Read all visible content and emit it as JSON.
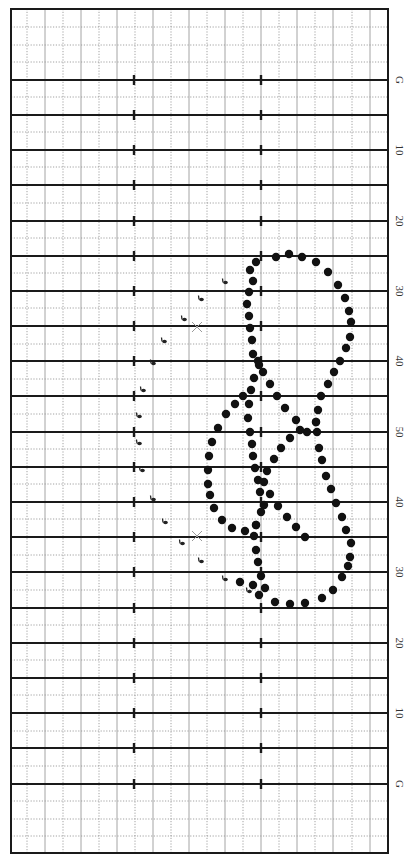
{
  "diagram": {
    "type": "marching-band-drill-chart",
    "orientation": "vertical-field",
    "colors": {
      "background": "#ffffff",
      "frame": "#1a1a1a",
      "yard_line": "#1a1a1a",
      "grid_solid": "#9a9a9a",
      "grid_dotted": "#8a8a8a",
      "dot": "#111111",
      "marker": "#222222",
      "x_mark": "#9a9a9a",
      "label": "#333333"
    },
    "field": {
      "frame": {
        "x": 11,
        "y": 9,
        "width": 377,
        "height": 844
      },
      "yard_lines_y": [
        80,
        115,
        150,
        185,
        221,
        256,
        291,
        326,
        361,
        396,
        432,
        467,
        502,
        537,
        572,
        608,
        643,
        678,
        713,
        748,
        784
      ],
      "hash_marks_x": [
        134,
        261
      ],
      "minor_lines_y_dotted": [
        27,
        45,
        62,
        97,
        132,
        167,
        203,
        238,
        273,
        308,
        344,
        379,
        414,
        449,
        484,
        519,
        555,
        590,
        625,
        660,
        695,
        731,
        766,
        801,
        819,
        836
      ],
      "vertical_lines_solid_x": [
        45,
        81,
        117,
        153,
        189,
        225,
        261,
        297,
        333,
        370
      ],
      "vertical_lines_dotted_x": [
        27,
        63,
        99,
        135,
        171,
        207,
        243,
        279,
        315,
        352
      ]
    },
    "yard_labels": [
      {
        "text": "G",
        "y": 80
      },
      {
        "text": "10",
        "y": 150
      },
      {
        "text": "20",
        "y": 221
      },
      {
        "text": "30",
        "y": 291
      },
      {
        "text": "40",
        "y": 361
      },
      {
        "text": "50",
        "y": 432
      },
      {
        "text": "40",
        "y": 502
      },
      {
        "text": "30",
        "y": 572
      },
      {
        "text": "20",
        "y": 643
      },
      {
        "text": "10",
        "y": 713
      },
      {
        "text": "G",
        "y": 784
      }
    ],
    "label_x": 400,
    "formation_dots": [
      [
        276,
        257
      ],
      [
        289,
        254
      ],
      [
        302,
        257
      ],
      [
        316,
        262
      ],
      [
        328,
        272
      ],
      [
        338,
        285
      ],
      [
        345,
        298
      ],
      [
        349,
        311
      ],
      [
        351,
        322
      ],
      [
        350,
        337
      ],
      [
        346,
        348
      ],
      [
        340,
        361
      ],
      [
        334,
        372
      ],
      [
        328,
        384
      ],
      [
        321,
        396
      ],
      [
        318,
        410
      ],
      [
        316,
        422
      ],
      [
        317,
        432
      ],
      [
        319,
        448
      ],
      [
        322,
        460
      ],
      [
        326,
        476
      ],
      [
        331,
        489
      ],
      [
        336,
        503
      ],
      [
        342,
        517
      ],
      [
        346,
        530
      ],
      [
        351,
        543
      ],
      [
        350,
        557
      ],
      [
        348,
        566
      ],
      [
        342,
        577
      ],
      [
        333,
        590
      ],
      [
        322,
        598
      ],
      [
        305,
        603
      ],
      [
        290,
        604
      ],
      [
        275,
        602
      ],
      [
        259,
        595
      ],
      [
        253,
        585
      ],
      [
        256,
        262
      ],
      [
        250,
        270
      ],
      [
        253,
        281
      ],
      [
        249,
        292
      ],
      [
        247,
        304
      ],
      [
        249,
        316
      ],
      [
        250,
        328
      ],
      [
        252,
        340
      ],
      [
        253,
        354
      ],
      [
        258,
        361
      ],
      [
        263,
        372
      ],
      [
        270,
        384
      ],
      [
        277,
        396
      ],
      [
        285,
        408
      ],
      [
        296,
        420
      ],
      [
        307,
        432
      ],
      [
        316,
        422
      ],
      [
        259,
        365
      ],
      [
        254,
        378
      ],
      [
        251,
        390
      ],
      [
        249,
        404
      ],
      [
        248,
        418
      ],
      [
        250,
        432
      ],
      [
        252,
        444
      ],
      [
        253,
        456
      ],
      [
        255,
        468
      ],
      [
        258,
        480
      ],
      [
        260,
        492
      ],
      [
        264,
        505
      ],
      [
        261,
        512
      ],
      [
        256,
        525
      ],
      [
        254,
        536
      ],
      [
        256,
        550
      ],
      [
        258,
        562
      ],
      [
        261,
        576
      ],
      [
        265,
        588
      ],
      [
        300,
        430
      ],
      [
        290,
        438
      ],
      [
        281,
        448
      ],
      [
        274,
        459
      ],
      [
        267,
        471
      ],
      [
        264,
        482
      ],
      [
        270,
        494
      ],
      [
        278,
        506
      ],
      [
        287,
        517
      ],
      [
        296,
        527
      ],
      [
        305,
        537
      ],
      [
        240,
        582
      ],
      [
        243,
        396
      ],
      [
        235,
        404
      ],
      [
        226,
        414
      ],
      [
        218,
        428
      ],
      [
        212,
        442
      ],
      [
        209,
        456
      ],
      [
        208,
        470
      ],
      [
        208,
        484
      ],
      [
        210,
        495
      ],
      [
        214,
        508
      ],
      [
        222,
        520
      ],
      [
        232,
        528
      ],
      [
        245,
        531
      ],
      [
        256,
        525
      ]
    ],
    "performer_markers": [
      {
        "x": 250,
        "y": 269
      },
      {
        "x": 224,
        "y": 281
      },
      {
        "x": 200,
        "y": 298
      },
      {
        "x": 183,
        "y": 318
      },
      {
        "x": 163,
        "y": 340
      },
      {
        "x": 152,
        "y": 362
      },
      {
        "x": 142,
        "y": 389
      },
      {
        "x": 138,
        "y": 415
      },
      {
        "x": 138,
        "y": 442
      },
      {
        "x": 141,
        "y": 469
      },
      {
        "x": 152,
        "y": 498
      },
      {
        "x": 164,
        "y": 521
      },
      {
        "x": 181,
        "y": 542
      },
      {
        "x": 200,
        "y": 560
      },
      {
        "x": 224,
        "y": 578
      },
      {
        "x": 248,
        "y": 590
      }
    ],
    "x_marks": [
      {
        "x": 197,
        "y": 327
      },
      {
        "x": 197,
        "y": 536
      }
    ]
  }
}
